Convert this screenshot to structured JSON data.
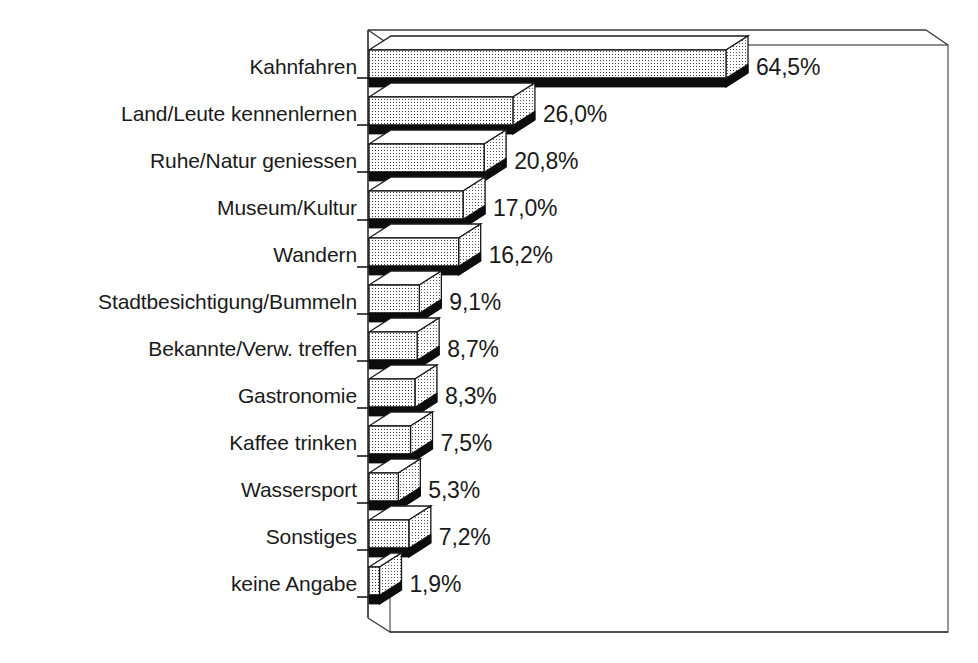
{
  "chart_data": {
    "type": "bar",
    "orientation": "horizontal",
    "style": "3d-bar",
    "title": "",
    "subtitle": "",
    "xlabel": "",
    "ylabel": "",
    "legend": null,
    "grid": false,
    "axis_ticks_labeled": false,
    "value_suffix": "%",
    "decimal_separator": ",",
    "xlim": [
      0,
      70
    ],
    "categories": [
      "Kahnfahren",
      "Land/Leute kennenlernen",
      "Ruhe/Natur geniessen",
      "Museum/Kultur",
      "Wandern",
      "Stadtbesichtigung/Bummeln",
      "Bekannte/Verw. treffen",
      "Gastronomie",
      "Kaffee trinken",
      "Wassersport",
      "Sonstiges",
      "keine Angabe"
    ],
    "values": [
      64.5,
      26.0,
      20.8,
      17.0,
      16.2,
      9.1,
      8.7,
      8.3,
      7.5,
      5.3,
      7.2,
      1.9
    ],
    "value_labels": [
      "64,5%",
      "26,0%",
      "20,8%",
      "17,0%",
      "16,2%",
      "9,1%",
      "8,7%",
      "8,3%",
      "7,5%",
      "5,3%",
      "7,2%",
      "1,9%"
    ],
    "colors": {
      "bar_face": "#ffffff",
      "bar_pattern_dot": "#3a3a3a",
      "bar_shadow": "#0d0d0d",
      "bar_side": "#ffffff",
      "outline": "#1a1a1a",
      "frame": "#555555",
      "background": "#ffffff",
      "text": "#1a1a1a"
    }
  }
}
